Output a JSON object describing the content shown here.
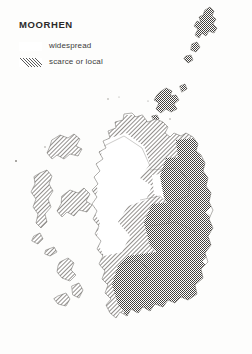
{
  "map": {
    "title": "MOORHEN",
    "subject": "Scotland bird distribution atlas map",
    "background_color": "#fdfdfc",
    "coastline_color": "#55524e",
    "legend": {
      "items": [
        {
          "key": "widespread",
          "label": "widespread",
          "pattern": "dense-stipple",
          "swatch_ink_color": "#3b3b3b"
        },
        {
          "key": "scarce-or-local",
          "label": "scarce or local",
          "pattern": "diagonal-hatch",
          "swatch_ink_color": "#5a5a5a"
        }
      ]
    },
    "areas": [
      {
        "name": "shetland",
        "fill": "widespread",
        "position": "top-right"
      },
      {
        "name": "orkney",
        "fill": "widespread",
        "position": "north of mainland"
      },
      {
        "name": "caithness-and-north-coast",
        "fill": "scarce-or-local",
        "position": "far north mainland"
      },
      {
        "name": "outer-hebrides",
        "fill": "scarce-or-local",
        "position": "north-west"
      },
      {
        "name": "inner-hebrides-and-west-highlands",
        "fill": "scarce-or-local",
        "position": "west"
      },
      {
        "name": "great-glen-and-central-highlands",
        "fill": "scarce-or-local",
        "position": "centre"
      },
      {
        "name": "north-east-and-moray",
        "fill": "widespread",
        "position": "east"
      },
      {
        "name": "central-belt-and-borders",
        "fill": "widespread",
        "position": "south-east"
      },
      {
        "name": "dumfries-and-galloway",
        "fill": "widespread",
        "position": "south"
      }
    ]
  }
}
